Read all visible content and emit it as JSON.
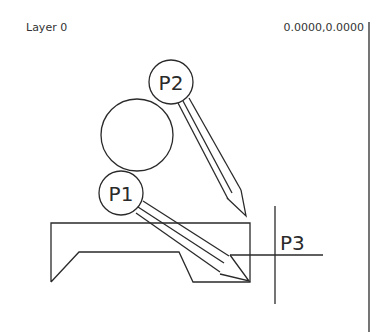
{
  "header": {
    "layer": "Layer 0",
    "coordinates": "0.0000,0.0000"
  },
  "drawing": {
    "markers": {
      "p1": "P1",
      "p2": "P2",
      "p3": "P3"
    },
    "stroke_color": "#2a2a2a",
    "background": "#ffffff"
  }
}
